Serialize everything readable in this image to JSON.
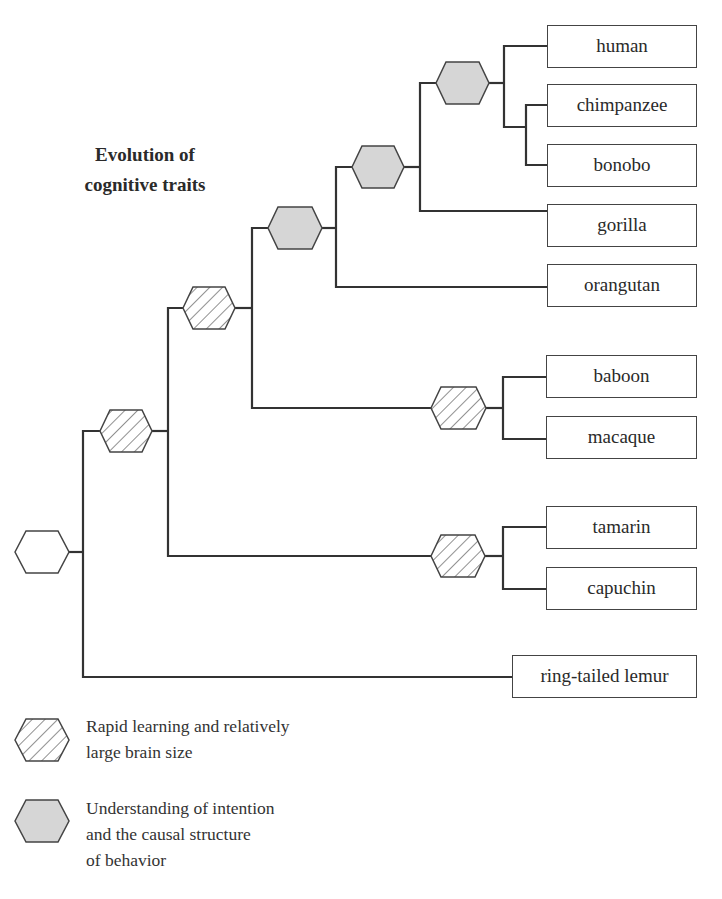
{
  "title": {
    "line1": "Evolution of",
    "line2": "cognitive traits"
  },
  "taxa": [
    {
      "id": "human",
      "label": "human"
    },
    {
      "id": "chimpanzee",
      "label": "chimpanzee"
    },
    {
      "id": "bonobo",
      "label": "bonobo"
    },
    {
      "id": "gorilla",
      "label": "gorilla"
    },
    {
      "id": "orangutan",
      "label": "orangutan"
    },
    {
      "id": "baboon",
      "label": "baboon"
    },
    {
      "id": "macaque",
      "label": "macaque"
    },
    {
      "id": "tamarin",
      "label": "tamarin"
    },
    {
      "id": "capuchin",
      "label": "capuchin"
    },
    {
      "id": "ring-tailed-lemur",
      "label": "ring-tailed lemur"
    }
  ],
  "nodes": [
    {
      "id": "root",
      "style": "empty"
    },
    {
      "id": "anthropoids",
      "style": "hatched"
    },
    {
      "id": "catarrhines",
      "style": "hatched"
    },
    {
      "id": "great-apes",
      "style": "gray"
    },
    {
      "id": "african-apes",
      "style": "gray"
    },
    {
      "id": "human-chimp-bonobo",
      "style": "gray"
    },
    {
      "id": "old-world-monkeys",
      "style": "hatched"
    },
    {
      "id": "new-world-monkeys",
      "style": "hatched"
    }
  ],
  "legend": [
    {
      "style": "hatched",
      "line1": "Rapid learning and relatively",
      "line2": "large brain size"
    },
    {
      "style": "gray",
      "line1": "Understanding of intention",
      "line2": "and the causal structure",
      "line3": "of behavior"
    }
  ],
  "colors": {
    "line": "#333333",
    "gray_fill": "#d6d6d6",
    "border": "#444444"
  }
}
